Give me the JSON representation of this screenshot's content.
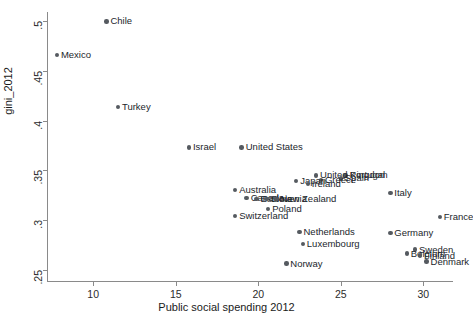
{
  "chart_data": {
    "type": "scatter",
    "title": "",
    "xlabel": "Public social spending 2012",
    "ylabel": "gini_2012",
    "xlim": [
      7.2,
      31.8
    ],
    "ylim": [
      0.2385,
      0.5095
    ],
    "xticks": [
      10,
      15,
      20,
      25,
      30
    ],
    "xtick_labels": [
      "10",
      "15",
      "20",
      "25",
      "30"
    ],
    "yticks": [
      0.25,
      0.3,
      0.35,
      0.4,
      0.45,
      0.5
    ],
    "ytick_labels": [
      ".25",
      ".3",
      ".35",
      ".4",
      ".45",
      ".5"
    ],
    "grid": false,
    "legend": false,
    "marker_color": "#555a60",
    "points": [
      {
        "label": "Chile",
        "x": 10.8,
        "y": 0.5
      },
      {
        "label": "Mexico",
        "x": 7.8,
        "y": 0.466
      },
      {
        "label": "Turkey",
        "x": 11.5,
        "y": 0.414
      },
      {
        "label": "Israel",
        "x": 15.8,
        "y": 0.373
      },
      {
        "label": "United States",
        "x": 19.0,
        "y": 0.373
      },
      {
        "label": "Portugal",
        "x": 25.3,
        "y": 0.345
      },
      {
        "label": "United Kingdom",
        "x": 23.5,
        "y": 0.345
      },
      {
        "label": "Spain",
        "x": 25.0,
        "y": 0.342
      },
      {
        "label": "Greece",
        "x": 23.8,
        "y": 0.34
      },
      {
        "label": "Japan",
        "x": 22.3,
        "y": 0.339
      },
      {
        "label": "Ireland",
        "x": 23.0,
        "y": 0.336
      },
      {
        "label": "Australia",
        "x": 18.6,
        "y": 0.33
      },
      {
        "label": "Italy",
        "x": 28.0,
        "y": 0.327
      },
      {
        "label": "Canada",
        "x": 19.3,
        "y": 0.322
      },
      {
        "label": "Estonia",
        "x": 19.9,
        "y": 0.321
      },
      {
        "label": "Slovenia",
        "x": 20.5,
        "y": 0.321
      },
      {
        "label": "New Zealand",
        "x": 21.1,
        "y": 0.321
      },
      {
        "label": "Poland",
        "x": 20.6,
        "y": 0.311
      },
      {
        "label": "Switzerland",
        "x": 18.6,
        "y": 0.304
      },
      {
        "label": "France",
        "x": 31.0,
        "y": 0.303
      },
      {
        "label": "Netherlands",
        "x": 22.5,
        "y": 0.288
      },
      {
        "label": "Germany",
        "x": 28.0,
        "y": 0.287
      },
      {
        "label": "Luxembourg",
        "x": 22.7,
        "y": 0.276
      },
      {
        "label": "Sweden",
        "x": 29.5,
        "y": 0.27
      },
      {
        "label": "Belgium",
        "x": 29.0,
        "y": 0.266
      },
      {
        "label": "Finland",
        "x": 29.8,
        "y": 0.264
      },
      {
        "label": "Norway",
        "x": 21.7,
        "y": 0.256
      },
      {
        "label": "Denmark",
        "x": 30.2,
        "y": 0.258
      }
    ]
  }
}
